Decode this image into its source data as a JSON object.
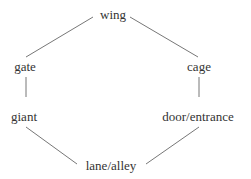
{
  "diagram": {
    "type": "hexagonal-cycle",
    "line_color": "#777777",
    "text_color": "#333333",
    "nodes": [
      {
        "id": "wing",
        "label": "wing",
        "x": 113,
        "y": 9
      },
      {
        "id": "gate",
        "label": "gate",
        "x": 25,
        "y": 61
      },
      {
        "id": "cage",
        "label": "cage",
        "x": 199,
        "y": 61
      },
      {
        "id": "giant",
        "label": "giant",
        "x": 24,
        "y": 111
      },
      {
        "id": "door",
        "label": "door/entrance",
        "x": 198,
        "y": 111
      },
      {
        "id": "lane",
        "label": "lane/alley",
        "x": 111,
        "y": 160
      }
    ],
    "edges": [
      {
        "from": "wing",
        "to": "gate"
      },
      {
        "from": "wing",
        "to": "cage"
      },
      {
        "from": "gate",
        "to": "giant"
      },
      {
        "from": "cage",
        "to": "door"
      },
      {
        "from": "giant",
        "to": "lane"
      },
      {
        "from": "door",
        "to": "lane"
      }
    ]
  }
}
